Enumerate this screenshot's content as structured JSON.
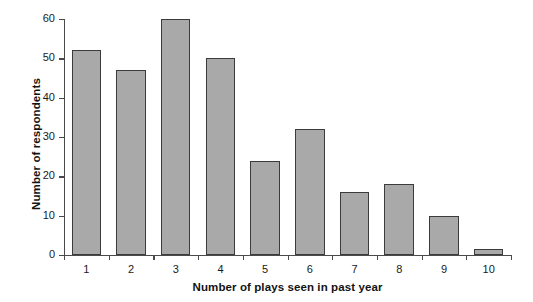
{
  "chart_data": {
    "type": "bar",
    "title": "",
    "xlabel": "Number of plays seen in past year",
    "ylabel": "Number of respondents",
    "categories": [
      "1",
      "2",
      "3",
      "4",
      "5",
      "6",
      "7",
      "8",
      "9",
      "10"
    ],
    "values": [
      52,
      47,
      60,
      50,
      24,
      32,
      16,
      18,
      10,
      1.5
    ],
    "ylim": [
      0,
      60
    ],
    "yticks": [
      0,
      10,
      20,
      30,
      40,
      50,
      60
    ],
    "ytick_labels": [
      "0",
      "10",
      "20",
      "30",
      "40",
      "50",
      "60"
    ],
    "grid": false,
    "legend": null,
    "bar_fill_color": "#a9a9a9",
    "bar_edge_color": "#3b3b3b",
    "axis_color": "#4a4a4a"
  },
  "axes": {
    "y_title": "Number of respondents",
    "x_title": "Number of plays seen in past year"
  },
  "title": {
    "text": ""
  }
}
